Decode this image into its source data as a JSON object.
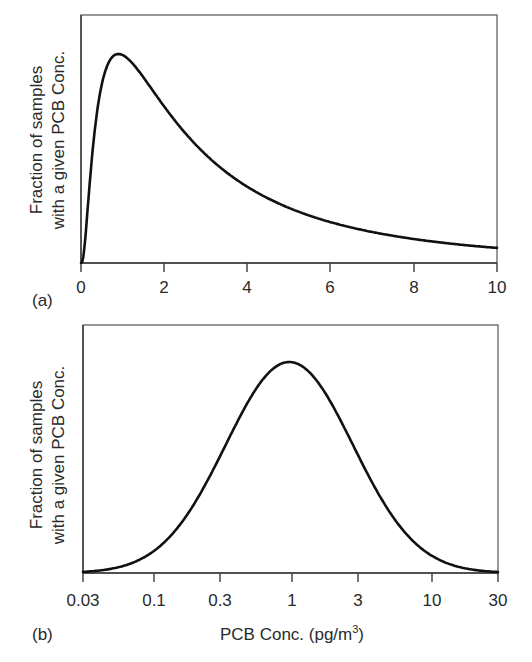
{
  "chart_data": [
    {
      "panel": "(a)",
      "type": "line",
      "title": "",
      "xlabel": "",
      "ylabel_lines": [
        "Fraction of samples",
        "with a given PCB Conc."
      ],
      "x_scale": "linear",
      "xlim": [
        0,
        10
      ],
      "ylim": [
        0,
        1
      ],
      "xticks": [
        0,
        2,
        4,
        6,
        8,
        10
      ],
      "xtick_labels": [
        "0",
        "2",
        "4",
        "6",
        "8",
        "10"
      ],
      "yticks": [],
      "grid": false,
      "legend": null,
      "distribution": "lognormal (linear x-axis)",
      "mode_approx": 0.9,
      "series": [
        {
          "name": "PCB concentration distribution",
          "x": [
            0,
            0.2,
            0.4,
            0.6,
            0.9,
            1.5,
            2,
            3,
            4,
            5,
            6,
            7,
            8,
            9,
            10
          ],
          "values": [
            0,
            0.35,
            0.78,
            0.95,
            1.0,
            0.88,
            0.76,
            0.55,
            0.37,
            0.25,
            0.17,
            0.12,
            0.09,
            0.07,
            0.06
          ]
        }
      ]
    },
    {
      "panel": "(b)",
      "type": "line",
      "title": "",
      "xlabel": "PCB Conc. (pg/m3)",
      "ylabel_lines": [
        "Fraction of samples",
        "with a given PCB Conc."
      ],
      "x_scale": "log",
      "xlim": [
        0.03,
        30
      ],
      "ylim": [
        0,
        1
      ],
      "xticks": [
        0.03,
        0.1,
        0.3,
        1,
        3,
        10,
        30
      ],
      "xtick_labels": [
        "0.03",
        "0.1",
        "0.3",
        "1",
        "3",
        "10",
        "30"
      ],
      "yticks": [],
      "grid": false,
      "legend": null,
      "distribution": "lognormal (log x-axis, appears Gaussian)",
      "median_approx": 0.93,
      "series": [
        {
          "name": "PCB concentration distribution",
          "x": [
            0.03,
            0.05,
            0.1,
            0.2,
            0.3,
            0.5,
            0.93,
            2,
            3,
            5,
            10,
            20,
            30
          ],
          "values": [
            0.0,
            0.02,
            0.1,
            0.35,
            0.53,
            0.82,
            1.0,
            0.78,
            0.53,
            0.26,
            0.06,
            0.01,
            0.0
          ]
        }
      ]
    }
  ],
  "panels": {
    "a": {
      "label": "(a)",
      "ylabel_line1": "Fraction of samples",
      "ylabel_line2": "with a given PCB Conc.",
      "ticks": [
        "0",
        "2",
        "4",
        "6",
        "8",
        "10"
      ]
    },
    "b": {
      "label": "(b)",
      "ylabel_line1": "Fraction of samples",
      "ylabel_line2": "with a given PCB Conc.",
      "ticks": [
        "0.03",
        "0.1",
        "0.3",
        "1",
        "3",
        "10",
        "30"
      ],
      "xlabel_main": "PCB Conc. (pg/m",
      "xlabel_sup": "3",
      "xlabel_end": ")"
    }
  },
  "curve_params": {
    "a": {
      "sigma": 1.05,
      "mode": 0.9
    },
    "b": {
      "sigma": 1.06,
      "median": 0.93
    }
  }
}
